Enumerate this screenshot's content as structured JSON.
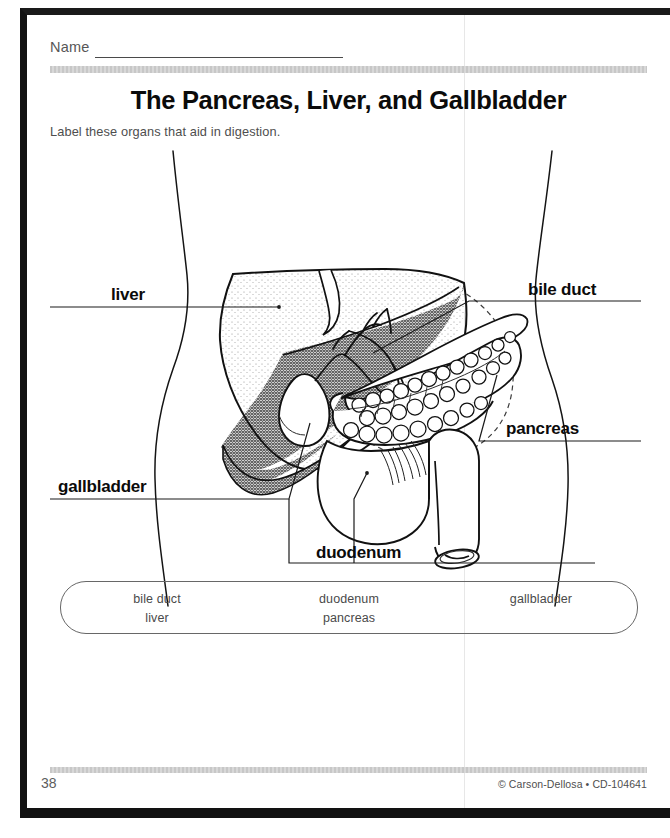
{
  "worksheet": {
    "name_label": "Name",
    "title": "The Pancreas, Liver, and Gallbladder",
    "instructions": "Label these organs that aid in digestion.",
    "page_number": "38",
    "credit": "© Carson-Dellosa • CD-104641"
  },
  "diagram": {
    "labels": [
      {
        "id": "liver",
        "text": "liver"
      },
      {
        "id": "bile_duct",
        "text": "bile duct"
      },
      {
        "id": "pancreas",
        "text": "pancreas"
      },
      {
        "id": "gallbladder",
        "text": "gallbladder"
      },
      {
        "id": "duodenum",
        "text": "duodenum"
      }
    ],
    "organs": [
      "liver",
      "gallbladder",
      "bile duct",
      "pancreas",
      "duodenum",
      "stomach outline"
    ]
  },
  "word_bank": {
    "columns": [
      {
        "words": [
          "bile duct",
          "liver"
        ]
      },
      {
        "words": [
          "duodenum",
          "pancreas"
        ]
      },
      {
        "words": [
          "gallbladder",
          ""
        ]
      }
    ]
  },
  "colors": {
    "ink": "#0b0b0b",
    "rule_gray": "#c8c8c8",
    "organ_shade": "#808080",
    "paper": "#ffffff",
    "frame": "#121212"
  }
}
